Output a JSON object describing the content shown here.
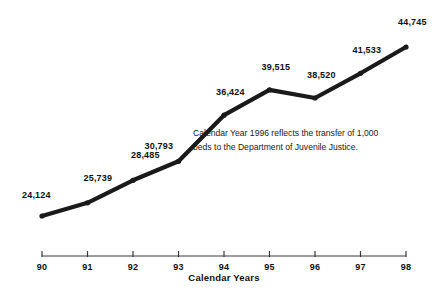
{
  "chart_data": {
    "type": "line",
    "title": "",
    "xlabel": "Calendar Years",
    "ylabel": "",
    "categories": [
      "90",
      "91",
      "92",
      "93",
      "94",
      "95",
      "96",
      "97",
      "98"
    ],
    "x": [
      1990,
      1991,
      1992,
      1993,
      1994,
      1995,
      1996,
      1997,
      1998
    ],
    "values": [
      24124,
      25739,
      28485,
      30793,
      36424,
      39515,
      38520,
      41533,
      44745
    ],
    "point_labels": [
      "24,124",
      "25,739",
      "28,485",
      "30,793",
      "36,424",
      "39,515",
      "38,520",
      "41,533",
      "44,745"
    ],
    "ylim": [
      22000,
      46000
    ],
    "grid": false,
    "legend": false,
    "series": [
      {
        "name": "Inmate Population",
        "values": [
          24124,
          25739,
          28485,
          30793,
          36424,
          39515,
          38520,
          41533,
          44745
        ]
      }
    ],
    "annotations": [
      {
        "text": "Calendar Year 1996 reflects the transfer of 1,000\nbeds to the Department of Juvenile Justice."
      }
    ],
    "line_color": "#1a1a1a",
    "marker_color": "#1a1a1a",
    "axis_color": "#3a3a3a"
  },
  "axis": {
    "title": "Calendar Years",
    "ticks": [
      "90",
      "91",
      "92",
      "93",
      "94",
      "95",
      "96",
      "97",
      "98"
    ]
  },
  "note": {
    "text": "Calendar Year 1996 reflects the transfer of 1,000\nbeds to the Department of Juvenile Justice."
  }
}
